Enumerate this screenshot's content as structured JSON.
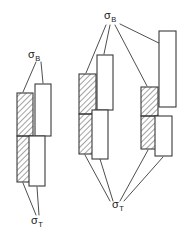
{
  "figure": {
    "colors": {
      "stroke": "#3a3a3a",
      "hatch": "#555555",
      "fill_white": "#ffffff",
      "background": "#ffffff",
      "text": "#1a1a1a"
    },
    "symbols": {
      "sigma": "σ",
      "sub_b": "B",
      "sub_t": "T"
    },
    "labels": [
      {
        "id": "left-sigma-b",
        "base": "σ",
        "sub": "B",
        "x": 28,
        "y": 58,
        "group": "left"
      },
      {
        "id": "left-sigma-t",
        "base": "σ",
        "sub": "T",
        "x": 31,
        "y": 224,
        "group": "left"
      },
      {
        "id": "right-sigma-b",
        "base": "σ",
        "sub": "B",
        "x": 104,
        "y": 19,
        "group": "right"
      },
      {
        "id": "right-sigma-t",
        "base": "σ",
        "sub": "T",
        "x": 112,
        "y": 208,
        "group": "right"
      }
    ],
    "groups": [
      {
        "id": "left-group",
        "name": "left-stress-diagram",
        "blocks": [
          {
            "id": "l-hatch-upper",
            "kind": "hatched",
            "x": 17,
            "y": 93,
            "w": 16,
            "h": 43
          },
          {
            "id": "l-hatch-lower",
            "kind": "hatched",
            "x": 17,
            "y": 136,
            "w": 16,
            "h": 46
          },
          {
            "id": "l-white-upper",
            "kind": "white",
            "x": 35,
            "y": 84,
            "w": 16,
            "h": 52
          },
          {
            "id": "l-white-lower",
            "kind": "white",
            "x": 29,
            "y": 136,
            "w": 16,
            "h": 50
          }
        ]
      },
      {
        "id": "right-left-group",
        "name": "right-figure-left-stress-diagram",
        "blocks": [
          {
            "id": "rl-hatch-upper",
            "kind": "hatched",
            "x": 79,
            "y": 74,
            "w": 17,
            "h": 40
          },
          {
            "id": "rl-hatch-lower",
            "kind": "hatched",
            "x": 79,
            "y": 114,
            "w": 17,
            "h": 40
          },
          {
            "id": "rl-white-upper",
            "kind": "white",
            "x": 97,
            "y": 55,
            "w": 16,
            "h": 55
          },
          {
            "id": "rl-white-lower",
            "kind": "white",
            "x": 92,
            "y": 110,
            "w": 16,
            "h": 49
          }
        ]
      },
      {
        "id": "right-right-group",
        "name": "right-figure-right-stress-diagram",
        "blocks": [
          {
            "id": "rr-hatch-upper",
            "kind": "hatched",
            "x": 141,
            "y": 87,
            "w": 17,
            "h": 29
          },
          {
            "id": "rr-hatch-lower",
            "kind": "hatched",
            "x": 141,
            "y": 116,
            "w": 17,
            "h": 33
          },
          {
            "id": "rr-white-upper",
            "kind": "white",
            "x": 159,
            "y": 31,
            "w": 17,
            "h": 76
          },
          {
            "id": "rr-white-lower",
            "kind": "white",
            "x": 155,
            "y": 116,
            "w": 17,
            "h": 40
          }
        ]
      }
    ],
    "leaders": [
      {
        "id": "ld-l-b-1",
        "from_label": "left-sigma-b",
        "points": "36,62 23,92"
      },
      {
        "id": "ld-l-b-2",
        "from_label": "left-sigma-b",
        "points": "41,62 43,83"
      },
      {
        "id": "ld-l-t-1",
        "from_label": "left-sigma-t",
        "points": "36,215 23,183"
      },
      {
        "id": "ld-l-t-2",
        "from_label": "left-sigma-t",
        "points": "39,215 37,187"
      },
      {
        "id": "ld-r-b-1",
        "from_label": "right-sigma-b",
        "points": "106,25 86,73"
      },
      {
        "id": "ld-r-b-2",
        "from_label": "right-sigma-b",
        "points": "110,25 104,54"
      },
      {
        "id": "ld-r-b-3",
        "from_label": "right-sigma-b",
        "points": "115,25 147,86"
      },
      {
        "id": "ld-r-b-4",
        "from_label": "right-sigma-b",
        "points": "120,24 167,47"
      },
      {
        "id": "ld-r-t-1",
        "from_label": "right-sigma-t",
        "points": "110,201 85,155"
      },
      {
        "id": "ld-r-t-2",
        "from_label": "right-sigma-t",
        "points": "113,201 100,159"
      },
      {
        "id": "ld-r-t-3",
        "from_label": "right-sigma-t",
        "points": "120,201 148,150"
      },
      {
        "id": "ld-r-t-4",
        "from_label": "right-sigma-t",
        "points": "124,201 163,157"
      }
    ]
  }
}
